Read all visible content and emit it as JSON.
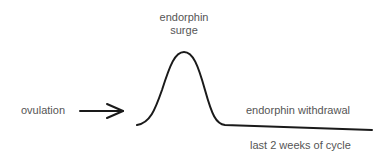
{
  "labels": {
    "surge_line1": "endorphin",
    "surge_line2": "surge",
    "ovulation": "ovulation",
    "withdrawal": "endorphin withdrawal",
    "cycle": "last 2 weeks of cycle"
  },
  "colors": {
    "stroke": "#1a1a1a",
    "text": "#555555",
    "background": "#ffffff"
  }
}
